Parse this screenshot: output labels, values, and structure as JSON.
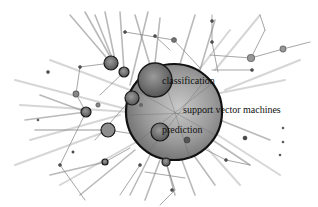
{
  "diagram": {
    "type": "keyword co-occurrence network",
    "colors": {
      "background": "#ffffff",
      "edge": "#8a8a8a",
      "node_fill": "#7d7d7d",
      "node_stroke": "#222222",
      "hub_fill": "#9a9a9a",
      "label": "#111111"
    },
    "labels": {
      "classification": "classification",
      "svm": "support vector machines",
      "prediction": "prediction"
    },
    "hub": {
      "id": "support-vector-machines",
      "cx": 174,
      "cy": 112,
      "r": 48
    },
    "nodes": [
      {
        "id": "classification",
        "cx": 155,
        "cy": 80,
        "r": 17
      },
      {
        "id": "prediction",
        "cx": 160,
        "cy": 132,
        "r": 9
      },
      {
        "id": "n1",
        "cx": 111,
        "cy": 63,
        "r": 7
      },
      {
        "id": "n2",
        "cx": 124,
        "cy": 72,
        "r": 5
      },
      {
        "id": "n3",
        "cx": 132,
        "cy": 98,
        "r": 7
      },
      {
        "id": "n4",
        "cx": 86,
        "cy": 112,
        "r": 5
      },
      {
        "id": "n5",
        "cx": 108,
        "cy": 130,
        "r": 7
      },
      {
        "id": "n6",
        "cx": 105,
        "cy": 162,
        "r": 3
      },
      {
        "id": "n7",
        "cx": 166,
        "cy": 162,
        "r": 4
      },
      {
        "id": "n8",
        "cx": 251,
        "cy": 58,
        "r": 4
      },
      {
        "id": "n9",
        "cx": 283,
        "cy": 49,
        "r": 3
      },
      {
        "id": "n10",
        "cx": 76,
        "cy": 94,
        "r": 3
      },
      {
        "id": "n11",
        "cx": 174,
        "cy": 40,
        "r": 3
      },
      {
        "id": "n12",
        "cx": 187,
        "cy": 140,
        "r": 3
      },
      {
        "id": "n13",
        "cx": 245,
        "cy": 138,
        "r": 2
      }
    ]
  }
}
